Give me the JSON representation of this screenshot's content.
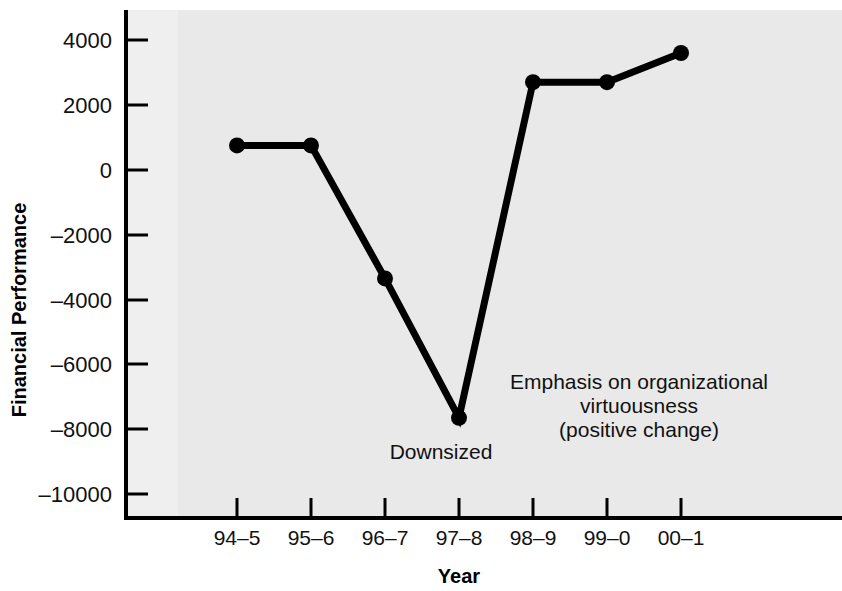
{
  "chart_data": {
    "type": "line",
    "title": "",
    "xlabel": "Year",
    "ylabel": "Financial Performance",
    "categories": [
      "94–5",
      "95–6",
      "96–7",
      "97–8",
      "98–9",
      "99–0",
      "00–1"
    ],
    "values": [
      750,
      750,
      -3350,
      -7650,
      2700,
      2700,
      3600
    ],
    "series": [
      {
        "name": "Financial Performance",
        "values": [
          750,
          750,
          -3350,
          -7650,
          2700,
          2700,
          3600
        ]
      }
    ],
    "ylim": [
      -10000,
      4000
    ],
    "ytick_labels": [
      "4000",
      "2000",
      "0",
      "–2000",
      "–4000",
      "–6000",
      "–8000",
      "–10000"
    ],
    "ytick_values": [
      4000,
      2000,
      0,
      -2000,
      -4000,
      -6000,
      -8000,
      -10000
    ],
    "grid": false,
    "legend": false,
    "legend_position": "none",
    "marker": "filled-circle",
    "line_color": "#000000",
    "marker_color": "#000000",
    "plot_background": "#e9e9e9",
    "annotations": [
      {
        "name": "downsized",
        "text": "Downsized",
        "lines": [
          "Downsized"
        ],
        "anchor_category": "97–8",
        "anchor_value": -7650
      },
      {
        "name": "virtuousness",
        "text": "Emphasis on organizational virtuousness (positive change)",
        "lines": [
          "Emphasis on organizational",
          "virtuousness",
          "(positive change)"
        ],
        "anchor_category": "98–9",
        "anchor_value": 2700
      }
    ]
  },
  "axes": {
    "x_title": "Year",
    "y_title": "Financial Performance"
  }
}
